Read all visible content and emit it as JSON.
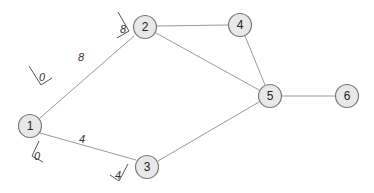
{
  "nodes": [
    {
      "id": "1",
      "label": "1",
      "x": 30,
      "y": 126
    },
    {
      "id": "2",
      "label": "2",
      "x": 145,
      "y": 27
    },
    {
      "id": "3",
      "label": "3",
      "x": 147,
      "y": 167
    },
    {
      "id": "4",
      "label": "4",
      "x": 240,
      "y": 25
    },
    {
      "id": "5",
      "label": "5",
      "x": 270,
      "y": 96
    },
    {
      "id": "6",
      "label": "6",
      "x": 347,
      "y": 96
    }
  ],
  "edges": [
    {
      "from": "1",
      "to": "2",
      "weight": "8",
      "start_label": "0",
      "end_label": "8"
    },
    {
      "from": "1",
      "to": "3",
      "weight": "4",
      "start_label": "0",
      "end_label": "4"
    },
    {
      "from": "2",
      "to": "4"
    },
    {
      "from": "2",
      "to": "5"
    },
    {
      "from": "3",
      "to": "5"
    },
    {
      "from": "4",
      "to": "5"
    },
    {
      "from": "5",
      "to": "6"
    }
  ],
  "labels": {
    "e12_start": "0",
    "e12_mid": "8",
    "e12_end": "8",
    "e13_start": "0",
    "e13_mid": "4",
    "e13_end": "4"
  },
  "colors": {
    "node_fill": "#e8e8e8",
    "node_stroke": "#7a7a7a",
    "edge": "#9a9a9a"
  }
}
